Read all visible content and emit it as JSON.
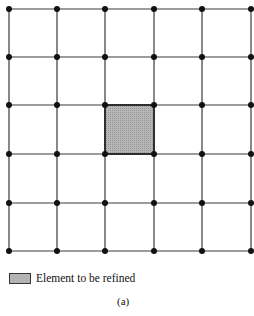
{
  "diagram": {
    "type": "finite-element-mesh",
    "grid": {
      "cols": 5,
      "rows": 5,
      "node_x": [
        9,
        57,
        105,
        154,
        202,
        251
      ],
      "node_y": [
        9,
        57,
        105,
        154,
        203,
        251
      ],
      "line_color": "#3a3a3a",
      "node_color": "#111111"
    },
    "highlighted_element": {
      "col": 2,
      "row": 2,
      "fill": "#b3b3b3",
      "stroke": "#222222"
    }
  },
  "legend": {
    "label": "Element to be refined",
    "swatch_color": "#b3b3b3"
  },
  "caption": "(a)"
}
